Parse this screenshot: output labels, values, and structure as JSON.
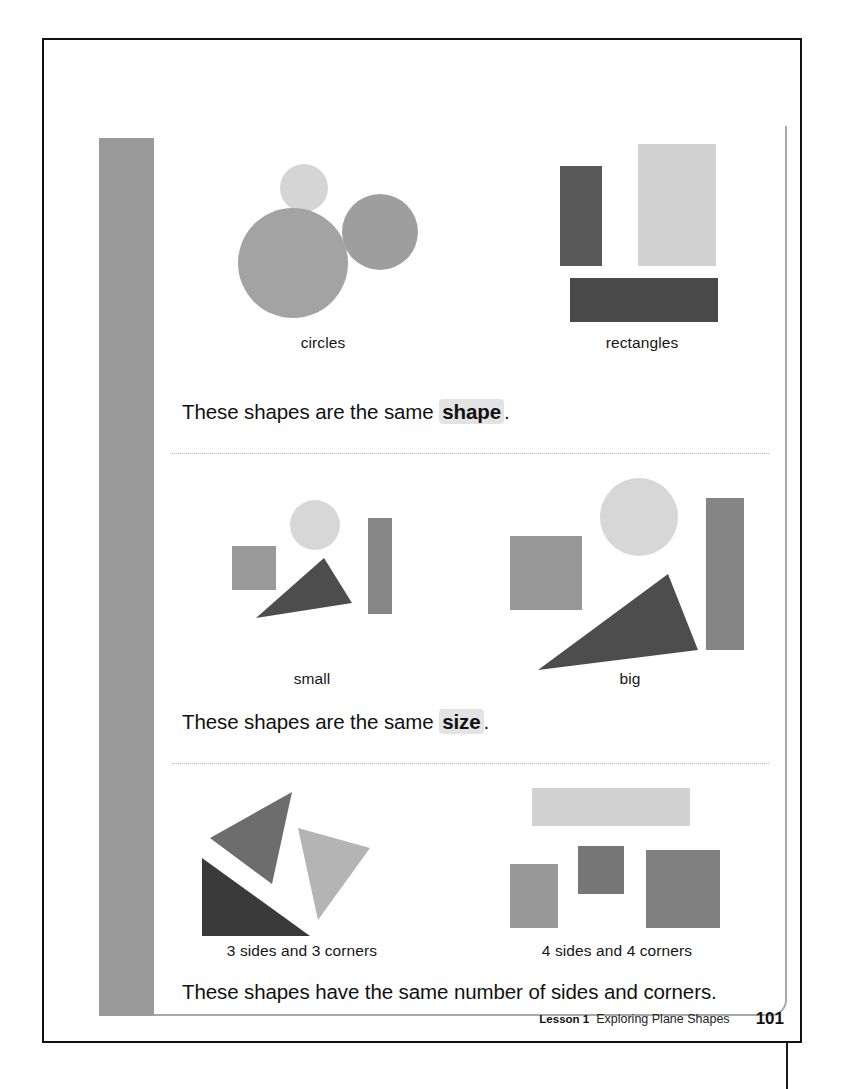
{
  "page": {
    "number": "101",
    "footer": {
      "lesson_label": "Lesson 1",
      "lesson_title": "Exploring Plane Shapes"
    }
  },
  "sections": [
    {
      "id": "same-shape",
      "statement_prefix": "These shapes are the same ",
      "statement_keyword": "shape",
      "statement_suffix": ".",
      "groups": [
        {
          "caption": "circles",
          "shapes": [
            {
              "name": "small-light-circle",
              "type": "circle",
              "x": 62,
              "y": 38,
              "w": 48,
              "h": 48,
              "color": "#d5d5d5"
            },
            {
              "name": "medium-grey-circle",
              "type": "circle",
              "x": 124,
              "y": 68,
              "w": 76,
              "h": 76,
              "color": "#9e9e9e"
            },
            {
              "name": "large-grey-circle",
              "type": "circle",
              "x": 20,
              "y": 82,
              "w": 110,
              "h": 110,
              "color": "#a3a3a3"
            }
          ]
        },
        {
          "caption": "rectangles",
          "shapes": [
            {
              "name": "tall-dark-rectangle",
              "type": "rect",
              "x": 18,
              "y": 40,
              "w": 42,
              "h": 100,
              "color": "#595959"
            },
            {
              "name": "tall-light-rectangle",
              "type": "rect",
              "x": 96,
              "y": 18,
              "w": 78,
              "h": 122,
              "color": "#d2d2d2"
            },
            {
              "name": "wide-dark-rectangle",
              "type": "rect",
              "x": 28,
              "y": 152,
              "w": 148,
              "h": 44,
              "color": "#4a4a4a"
            }
          ]
        }
      ]
    },
    {
      "id": "same-size",
      "statement_prefix": "These shapes are the same ",
      "statement_keyword": "size",
      "statement_suffix": ".",
      "groups": [
        {
          "caption": "small",
          "shapes": [
            {
              "name": "small-square",
              "type": "rect",
              "x": 20,
              "y": 68,
              "w": 44,
              "h": 44,
              "color": "#9a9a9a"
            },
            {
              "name": "small-circle",
              "type": "circle",
              "x": 78,
              "y": 22,
              "w": 50,
              "h": 50,
              "color": "#d7d7d7"
            },
            {
              "name": "small-bar",
              "type": "rect",
              "x": 156,
              "y": 40,
              "w": 24,
              "h": 96,
              "color": "#868686"
            },
            {
              "name": "small-triangle",
              "type": "triangle",
              "x": 44,
              "y": 80,
              "w": 96,
              "h": 60,
              "color": "#4d4d4d",
              "points": "0,60 68,0 96,45"
            }
          ]
        },
        {
          "caption": "big",
          "shapes": [
            {
              "name": "big-square",
              "type": "rect",
              "x": 0,
              "y": 58,
              "w": 72,
              "h": 74,
              "color": "#989898"
            },
            {
              "name": "big-circle",
              "type": "circle",
              "x": 90,
              "y": 0,
              "w": 78,
              "h": 78,
              "color": "#d7d7d7"
            },
            {
              "name": "big-bar",
              "type": "rect",
              "x": 196,
              "y": 20,
              "w": 38,
              "h": 152,
              "color": "#858585"
            },
            {
              "name": "big-triangle",
              "type": "triangle",
              "x": 28,
              "y": 96,
              "w": 160,
              "h": 96,
              "color": "#4d4d4d",
              "points": "0,96 130,0 160,76"
            }
          ]
        }
      ]
    },
    {
      "id": "same-sides-corners",
      "statement_prefix": "These shapes have the same number of sides and corners.",
      "statement_keyword": "",
      "statement_suffix": "",
      "groups": [
        {
          "caption": "3 sides and 3 corners",
          "shapes": [
            {
              "name": "grey-triangle-left",
              "type": "triangle",
              "x": 8,
              "y": 10,
              "w": 82,
              "h": 92,
              "color": "#6d6d6d",
              "points": "0,46 82,0 62,92"
            },
            {
              "name": "light-triangle-right",
              "type": "triangle",
              "x": 96,
              "y": 46,
              "w": 72,
              "h": 92,
              "color": "#b4b4b4",
              "points": "0,0 72,20 20,92"
            },
            {
              "name": "dark-triangle-bottom",
              "type": "triangle",
              "x": 0,
              "y": 76,
              "w": 108,
              "h": 78,
              "color": "#3a3a3a",
              "points": "0,0 108,78 0,78"
            }
          ]
        },
        {
          "caption": "4 sides and 4 corners",
          "shapes": [
            {
              "name": "wide-light-rectangle",
              "type": "rect",
              "x": 22,
              "y": 0,
              "w": 158,
              "h": 38,
              "color": "#d2d2d2"
            },
            {
              "name": "grey-rectangle-left",
              "type": "rect",
              "x": 0,
              "y": 76,
              "w": 48,
              "h": 64,
              "color": "#999999"
            },
            {
              "name": "grey-square-middle",
              "type": "rect",
              "x": 68,
              "y": 58,
              "w": 46,
              "h": 48,
              "color": "#777777"
            },
            {
              "name": "grey-square-right",
              "type": "rect",
              "x": 136,
              "y": 62,
              "w": 74,
              "h": 78,
              "color": "#808080"
            }
          ]
        }
      ]
    }
  ]
}
